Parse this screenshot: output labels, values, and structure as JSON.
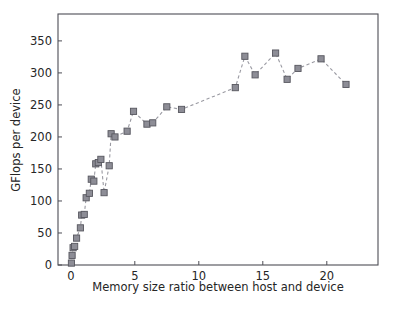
{
  "figure": {
    "background_color": "#ffffff",
    "frame_color": "#4d4d55",
    "plot_area": {
      "left": 58,
      "top": 14,
      "right": 378,
      "bottom": 265
    }
  },
  "chart_data": {
    "type": "line",
    "title": "",
    "subtitle": "",
    "xlabel": "Memory size ratio between host and device",
    "ylabel": "GFlops per device",
    "xlim": [
      -1.0,
      24.0
    ],
    "ylim": [
      0,
      392
    ],
    "xticks": [
      0,
      5,
      10,
      15,
      20
    ],
    "xticklabels": [
      "0",
      "5",
      "10",
      "15",
      "20"
    ],
    "yticks": [
      0,
      50,
      100,
      150,
      200,
      250,
      300,
      350
    ],
    "yticklabels": [
      "0",
      "50",
      "100",
      "150",
      "200",
      "250",
      "300",
      "350"
    ],
    "grid": false,
    "legend": null,
    "marker": "square",
    "marker_face_color": "#8d8d96",
    "marker_edge_color": "#56565e",
    "line_style": "dashed",
    "line_color": "#9a9aa2",
    "series": [
      {
        "name": "GFlops per device",
        "x": [
          0.05,
          0.1,
          0.18,
          0.3,
          0.45,
          0.75,
          0.85,
          1.05,
          1.2,
          1.45,
          1.6,
          1.8,
          1.95,
          2.15,
          2.35,
          2.6,
          3.0,
          3.15,
          3.45,
          4.4,
          4.9,
          5.95,
          6.4,
          7.5,
          8.65,
          12.85,
          13.6,
          14.4,
          16.0,
          16.9,
          17.75,
          19.55,
          21.5
        ],
        "y": [
          3,
          15,
          27,
          29,
          42,
          58,
          78,
          79,
          105,
          112,
          134,
          131,
          158,
          160,
          165,
          113,
          155,
          205,
          200,
          209,
          240,
          220,
          222,
          247,
          243,
          277,
          326,
          297,
          331,
          290,
          307,
          322,
          282
        ]
      }
    ]
  }
}
